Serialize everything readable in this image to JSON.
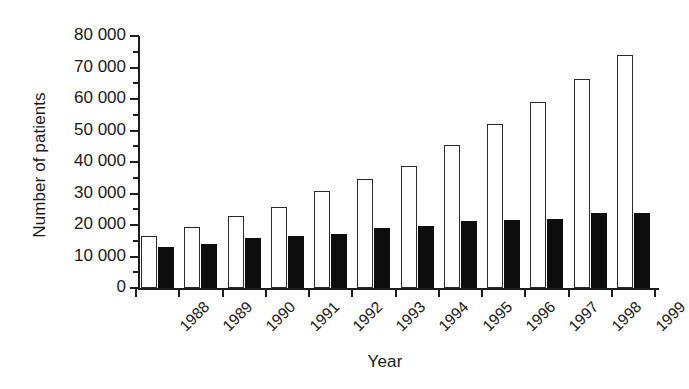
{
  "chart_data": {
    "type": "bar",
    "title": "",
    "xlabel": "Year",
    "ylabel": "Number of patients",
    "categories": [
      "1988",
      "1989",
      "1990",
      "1991",
      "1992",
      "1993",
      "1994",
      "1995",
      "1996",
      "1997",
      "1998",
      "1999"
    ],
    "series": [
      {
        "name": "open",
        "style": "open-white-bar",
        "values": [
          16500,
          19500,
          23000,
          25700,
          30700,
          34500,
          38800,
          45500,
          52000,
          59000,
          66500,
          74000
        ]
      },
      {
        "name": "filled",
        "style": "solid-black-bar",
        "values": [
          13000,
          14000,
          16000,
          16400,
          17200,
          19000,
          19800,
          21200,
          21600,
          22000,
          23700,
          23900
        ]
      }
    ],
    "ylim": [
      0,
      80000
    ],
    "ytick_labels": [
      "0",
      "10 000",
      "20 000",
      "30 000",
      "40 000",
      "50 000",
      "60 000",
      "70 000",
      "80 000"
    ],
    "ytick_values": [
      0,
      10000,
      20000,
      30000,
      40000,
      50000,
      60000,
      70000,
      80000
    ],
    "yminor_step": 5000,
    "grid": false,
    "legend": "none",
    "legend_position": "none",
    "colors": {
      "axis": "#1d1d1d",
      "open_bar_fill": "#ffffff",
      "open_bar_edge": "#2b2b2b",
      "filled_bar": "#0d0d0d",
      "background": "#ffffff",
      "text": "#1a1a1a"
    }
  }
}
